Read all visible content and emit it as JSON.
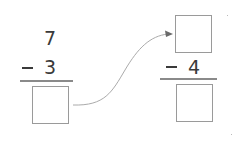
{
  "diagram": {
    "type": "subtraction-chain",
    "colors": {
      "digit": "#3a3a3a",
      "rule": "#8a8a8a",
      "box_border": "#9a9a9a",
      "arrow": "#9a9a9a"
    },
    "left_problem": {
      "minuend": "7",
      "operator": "−",
      "subtrahend": "3",
      "answer": ""
    },
    "right_problem": {
      "minuend": "",
      "operator": "−",
      "subtrahend": "4",
      "answer": ""
    },
    "arrow": {
      "from": "left-answer-box",
      "to": "right-minuend-box"
    }
  }
}
